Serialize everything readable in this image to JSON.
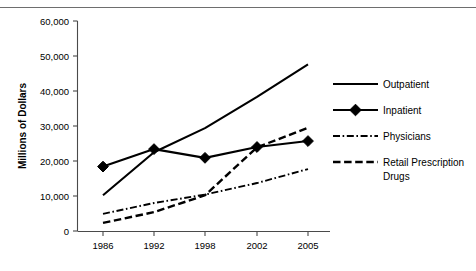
{
  "figure": {
    "title_fragment": "",
    "background_color": "#ffffff",
    "ink_color": "#000000",
    "axis_color": "#4a4a4a",
    "rule_color": "#6e6e6e"
  },
  "chart_data": {
    "type": "line",
    "title": "",
    "xlabel": "",
    "ylabel": "Millions of Dollars",
    "x": [
      "1986",
      "1992",
      "1998",
      "2002",
      "2005"
    ],
    "categories": [
      "1986",
      "1992",
      "1998",
      "2002",
      "2005"
    ],
    "xtick_labels": [
      "1986",
      "1992",
      "1998",
      "2002",
      "2005"
    ],
    "ytick_labels": [
      "0",
      "10,000",
      "20,000",
      "30,000",
      "40,000",
      "50,000",
      "60,000"
    ],
    "ytick_values": [
      0,
      10000,
      20000,
      30000,
      40000,
      50000,
      60000
    ],
    "ylim": [
      0,
      60000
    ],
    "grid": false,
    "legend_position": "right",
    "series": [
      {
        "name": "Outpatient",
        "style": "solid",
        "marker": "none",
        "values": [
          10200,
          22500,
          29400,
          38300,
          47600
        ]
      },
      {
        "name": "Inpatient",
        "style": "solid",
        "marker": "diamond",
        "values": [
          18400,
          23400,
          20900,
          24000,
          25700
        ]
      },
      {
        "name": "Physicians",
        "style": "dash-dot",
        "marker": "none",
        "values": [
          4900,
          8000,
          10400,
          13700,
          17700
        ]
      },
      {
        "name": "Retail Prescription Drugs",
        "style": "dashed",
        "marker": "none",
        "values": [
          2300,
          5400,
          10200,
          23900,
          29500
        ]
      }
    ]
  },
  "legend": {
    "items": [
      {
        "label": "Outpatient",
        "style": "solid",
        "marker": "none"
      },
      {
        "label": "Inpatient",
        "style": "solid",
        "marker": "diamond"
      },
      {
        "label": "Physicians",
        "style": "dash-dot",
        "marker": "none"
      },
      {
        "label": "Retail Prescription",
        "label_line2": "Drugs",
        "style": "dashed",
        "marker": "none"
      }
    ]
  }
}
